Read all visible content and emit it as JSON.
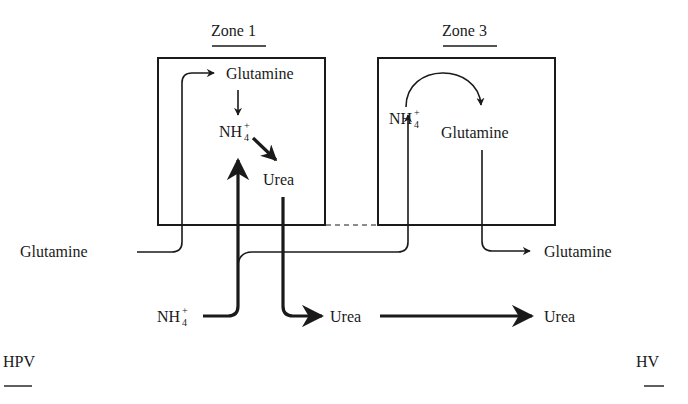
{
  "zones": {
    "zone1": {
      "title": "Zone 1",
      "glutamine": "Glutamine",
      "ammonium": "NH",
      "ammonium_sub": "4",
      "ammonium_sup": "+",
      "urea": "Urea"
    },
    "zone3": {
      "title": "Zone 3",
      "ammonium": "NH",
      "ammonium_sub": "4",
      "ammonium_sup": "+",
      "glutamine": "Glutamine"
    }
  },
  "outside": {
    "glutamine_in": "Glutamine",
    "ammonium_in": "NH",
    "ammonium_in_sub": "4",
    "ammonium_in_sup": "+",
    "urea_mid": "Urea",
    "urea_out": "Urea",
    "glutamine_out": "Glutamine"
  },
  "vessels": {
    "inlet": "HPV",
    "outlet": "HV"
  }
}
